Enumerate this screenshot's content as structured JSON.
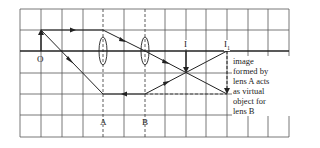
{
  "diagram": {
    "type": "ray-diagram-two-converging-lenses",
    "labels": {
      "object": "O",
      "lens_a": "A",
      "lens_b": "B",
      "image": "I",
      "image_1": "I",
      "image_1_subscript": "1"
    },
    "annotation": {
      "lines": [
        "image",
        "formed by",
        "lens A acts",
        "as virtual",
        "object for",
        "lens B"
      ]
    },
    "colors": {
      "line": "#222222",
      "grid": "#333333",
      "background": "#ffffff"
    }
  }
}
